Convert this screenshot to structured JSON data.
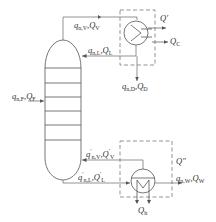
{
  "diagram": {
    "colors": {
      "line": "#555555",
      "dashed_box": "#666666",
      "text": "#333333",
      "background": "#ffffff"
    },
    "labels": {
      "top_vapor": {
        "q": "q",
        "sub": "n,V",
        "sep": ",",
        "Q": "Q",
        "Qsub": "V"
      },
      "reflux": {
        "q": "q",
        "sub": "n,L",
        "sep": ",",
        "Q": "Q",
        "Qsub": "L"
      },
      "distillate": {
        "q": "q",
        "sub": "n,D",
        "sep": ",",
        "Q": "Q",
        "Qsub": "D"
      },
      "feed": {
        "q": "q",
        "sub": "n,F",
        "sep": ",",
        "Q": "Q",
        "Qsub": "F"
      },
      "condenser_loss": {
        "Q": "Q",
        "prime": "′"
      },
      "condenser_duty": {
        "Q": "Q",
        "Qsub": "C"
      },
      "bottom_vapor": {
        "q": "q",
        "prime": "′",
        "sub": "n,V",
        "sep": ",",
        "Q": "Q",
        "Qsub": "V"
      },
      "bottom_liquid": {
        "q": "q",
        "prime": "′",
        "sub": "n,L",
        "sep": ",",
        "Q": "Q",
        "Qsub": "L"
      },
      "reboiler_loss": {
        "Q": "Q",
        "prime": "″"
      },
      "bottoms": {
        "q": "q",
        "sub": "n,W",
        "sep": ",",
        "Q": "Q",
        "Qsub": "W"
      },
      "heating": {
        "Q": "Q",
        "Qsub": "h"
      }
    },
    "nodes": [
      {
        "id": "column",
        "type": "tray-column",
        "trays": 6
      },
      {
        "id": "condenser",
        "type": "heat-exchanger"
      },
      {
        "id": "reboiler",
        "type": "heat-exchanger"
      }
    ]
  }
}
